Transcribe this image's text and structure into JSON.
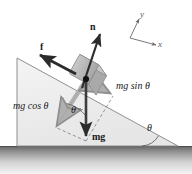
{
  "figure": {
    "background_color": "#ffffff",
    "incline": {
      "angle_symbol": "θ",
      "apex": [
        17,
        58
      ],
      "bottom_left": [
        17,
        146
      ],
      "bottom_right": [
        178,
        146
      ],
      "face_fill": "#eeeeee",
      "edge_color": "#8a8a8a"
    },
    "ground": {
      "top_color": "#6f6f6f",
      "bottom_color": "#f2f2f2"
    }
  },
  "labels": {
    "normal_force": "n",
    "friction_force": "f",
    "weight": "mg",
    "weight_parallel": "mg sin θ",
    "weight_perpendicular": "mg cos θ",
    "angle_at_weight": "θ",
    "angle_at_base": "θ",
    "axis_y": "y",
    "axis_x": "x"
  },
  "vectors": [
    {
      "name": "normal-force",
      "label": "n",
      "style": "bold-dark",
      "color": "#262626",
      "from": [
        86,
        80
      ],
      "to": [
        99,
        35
      ],
      "description": "Normal force perpendicular to incline surface, pointing up-right"
    },
    {
      "name": "friction-force",
      "label": "f",
      "style": "bold-dark",
      "color": "#262626",
      "from": [
        72,
        72
      ],
      "to": [
        38,
        56
      ],
      "description": "Friction force directed up the incline"
    },
    {
      "name": "weight",
      "label": "mg",
      "style": "bold-dark",
      "color": "#3a3a3a",
      "from": [
        86,
        80
      ],
      "to": [
        86,
        141
      ],
      "description": "Gravitational force, straight down"
    },
    {
      "name": "weight-parallel-component",
      "label": "mg sin θ",
      "style": "thick-gray",
      "color": "#b4b4b4",
      "from": [
        86,
        80
      ],
      "to": [
        112,
        95
      ],
      "description": "Component of weight parallel to incline, down-slope"
    },
    {
      "name": "weight-perpendicular-component",
      "label": "mg cos θ",
      "style": "thick-gray",
      "color": "#a8a8a8",
      "from": [
        86,
        80
      ],
      "to": [
        56,
        127
      ],
      "description": "Component of weight perpendicular into the incline"
    }
  ],
  "axes": {
    "origin": [
      130,
      38
    ],
    "y_tip": [
      140,
      17
    ],
    "x_tip": [
      158,
      46
    ],
    "color": "#6a6a6a"
  },
  "dashed_lines": [
    {
      "name": "parallel-construction",
      "from": [
        86,
        141
      ],
      "to": [
        112,
        95
      ]
    },
    {
      "name": "perpendicular-construction",
      "from": [
        86,
        141
      ],
      "to": [
        56,
        127
      ]
    }
  ],
  "block": {
    "name": "block",
    "center": [
      86,
      80
    ],
    "fill_top": "#cfcfcf",
    "fill_front": "#bdbdbd",
    "fill_side": "#a9a9a9",
    "edge_color": "#8c8c8c"
  },
  "angle_arcs": [
    {
      "name": "theta-at-center-of-mass",
      "label": "θ",
      "position": [
        73,
        110
      ]
    },
    {
      "name": "theta-at-incline-base",
      "label": "θ",
      "position": [
        150,
        130
      ]
    }
  ],
  "label_positions": {
    "normal_force": {
      "x": 90,
      "y": 24,
      "size": 9
    },
    "friction_force": {
      "x": 40,
      "y": 45,
      "size": 9
    },
    "weight": {
      "x": 90,
      "y": 136,
      "size": 9
    },
    "weight_parallel": {
      "x": 116,
      "y": 83,
      "size": 9
    },
    "weight_perpendicular": {
      "x": 14,
      "y": 103,
      "size": 9
    },
    "angle_at_weight": {
      "x": 73,
      "y": 109,
      "size": 9
    },
    "angle_at_base": {
      "x": 148,
      "y": 127,
      "size": 9
    },
    "axis_y": {
      "x": 141,
      "y": 12,
      "size": 8
    },
    "axis_x": {
      "x": 159,
      "y": 42,
      "size": 8
    }
  }
}
